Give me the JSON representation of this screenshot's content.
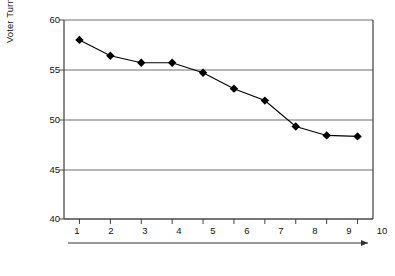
{
  "chart_data": {
    "type": "line",
    "title": "",
    "xlabel": "Deciles of Increasing Heterogeneity",
    "ylabel": "Voter Turnout (%)",
    "categories": [
      "1",
      "2",
      "3",
      "4",
      "5",
      "6",
      "7",
      "8",
      "9",
      "10"
    ],
    "values": [
      58.0,
      56.4,
      55.7,
      55.7,
      54.7,
      53.1,
      51.9,
      49.3,
      48.4,
      48.3
    ],
    "series": [
      {
        "name": "Voter Turnout",
        "values": [
          58.0,
          56.4,
          55.7,
          55.7,
          54.7,
          53.1,
          51.9,
          49.3,
          48.4,
          48.3
        ]
      }
    ],
    "ylim": [
      40,
      60
    ],
    "yticks": [
      40,
      45,
      50,
      55,
      60
    ],
    "ytick_labels": [
      "40",
      "45",
      "50",
      "55",
      "60"
    ],
    "xtick_labels": [
      "1",
      "2",
      "3",
      "4",
      "5",
      "6",
      "7",
      "8",
      "9",
      "10"
    ],
    "grid": "horizontal",
    "legend": "none",
    "marker": "diamond",
    "line_color": "#000000",
    "marker_color": "#000000",
    "grid_color": "#808080",
    "axis_color": "#404040",
    "background": "#ffffff",
    "x_axis_arrow": true
  }
}
